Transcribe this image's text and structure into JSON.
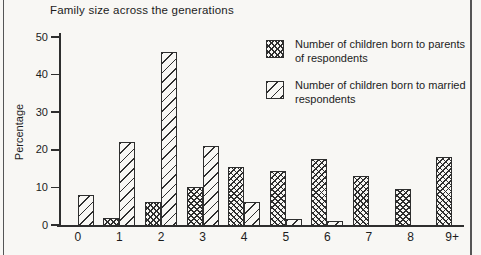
{
  "colors": {
    "ink": "#2e2e2e",
    "paper": "#f8f7f4",
    "text": "#1c1c1c",
    "edge": "#555555"
  },
  "chart": {
    "title": "Family size across the generations",
    "ylabel": "Percentage",
    "y_ticks": [
      0,
      10,
      20,
      30,
      40,
      50
    ],
    "x_tick_labels": [
      "0",
      "1",
      "2",
      "3",
      "4",
      "5",
      "6",
      "7",
      "8",
      "9+"
    ],
    "legend": [
      {
        "label": "Number of children born to parents of respondents",
        "pattern": "crosshatch"
      },
      {
        "label": "Number of children born to married respondents",
        "pattern": "diagonal"
      }
    ]
  },
  "chart_data": {
    "type": "bar",
    "title": "Family size across the generations",
    "categories": [
      "0",
      "1",
      "2",
      "3",
      "4",
      "5",
      "6",
      "7",
      "8",
      "9+"
    ],
    "series": [
      {
        "name": "Number of children born to parents of respondents",
        "pattern": "crosshatch",
        "values": [
          0,
          2,
          6,
          10,
          15.5,
          14.5,
          17.5,
          13,
          9.5,
          18
        ]
      },
      {
        "name": "Number of children born to married respondents",
        "pattern": "diagonal",
        "values": [
          8,
          22,
          46,
          21,
          6,
          1.5,
          1,
          0,
          0,
          0
        ]
      }
    ],
    "xlabel": "",
    "ylabel": "Percentage",
    "ylim": [
      0,
      50
    ],
    "y_tick_step": 10,
    "grid": false,
    "legend_position": "upper right"
  }
}
